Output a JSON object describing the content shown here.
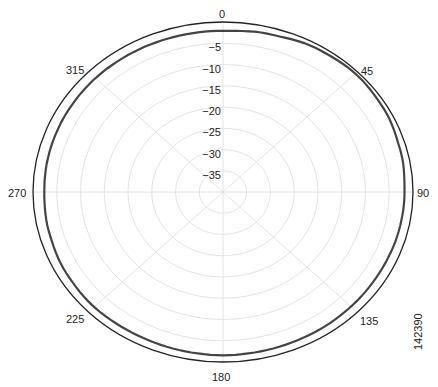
{
  "chart_data": {
    "type": "polar",
    "title": "",
    "angle_unit": "degrees",
    "angle_ticks": [
      0,
      45,
      90,
      135,
      180,
      225,
      270,
      315
    ],
    "angle_labels": [
      "0",
      "45",
      "90",
      "135",
      "180",
      "225",
      "270",
      "315"
    ],
    "radial_unit": "dB",
    "radial_ticks": [
      0,
      -5,
      -10,
      -15,
      -20,
      -25,
      -30,
      -35
    ],
    "radial_labels": [
      "0",
      "-5",
      "-10",
      "-15",
      "-20",
      "-25",
      "-30",
      "-35"
    ],
    "rlim": [
      -40,
      0
    ],
    "grid": true,
    "series": [
      {
        "name": "radiation pattern",
        "type": "polar line",
        "angles": [
          0,
          15,
          30,
          45,
          60,
          75,
          90,
          105,
          120,
          135,
          150,
          165,
          180,
          195,
          210,
          225,
          240,
          255,
          270,
          285,
          300,
          315,
          330,
          345
        ],
        "values": [
          -1.5,
          -1.0,
          -0.3,
          0.0,
          -0.3,
          -0.8,
          -1.2,
          -1.3,
          -1.4,
          -1.3,
          -1.2,
          -1.1,
          -1.0,
          -1.1,
          -1.2,
          -1.1,
          -1.3,
          -1.6,
          -1.8,
          -1.7,
          -1.6,
          -1.5,
          -1.5,
          -1.5
        ]
      }
    ]
  },
  "figure_id": "142390"
}
